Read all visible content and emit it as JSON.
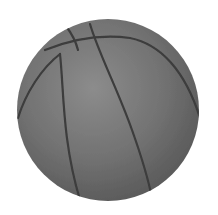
{
  "image": {
    "subject": "basketball",
    "style": "grayscale",
    "colors": {
      "background": "#ffffff",
      "ball_light": "#8a8a8a",
      "ball_mid": "#6e6e6e",
      "ball_dark": "#4f4f4f",
      "seam": "#3a3a3a"
    }
  }
}
